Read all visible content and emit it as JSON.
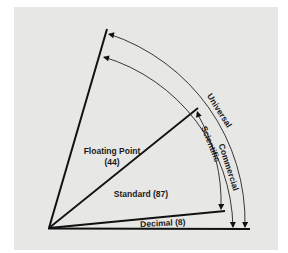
{
  "diagram": {
    "colors": {
      "background": "#e7e7e5",
      "line": "#111111"
    },
    "regions": {
      "floating_point": {
        "label": "Floating Point",
        "count": "(44)"
      },
      "standard": {
        "label": "Standard (87)"
      },
      "decimal": {
        "label": "Decimal (8)"
      }
    },
    "arcs": {
      "scientific": "Scientific",
      "commercial": "Commercial",
      "universal": "Universal"
    }
  }
}
